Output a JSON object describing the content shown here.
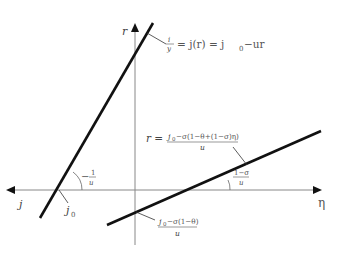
{
  "diagram": {
    "axes": {
      "vertical_label": "r",
      "horizontal_right_label": "η",
      "horizontal_left_label": "j"
    },
    "lines": [
      {
        "name": "steep-line",
        "equation_label": {
          "frac_num": "i",
          "frac_den": "y",
          "rest": "= j(r) = j",
          "sub": "0",
          "tail": "−ur"
        },
        "intercept_label": {
          "base": "j",
          "sub": "0"
        },
        "slope_label": {
          "prefix": "−",
          "num": "1",
          "den": "u"
        }
      },
      {
        "name": "shallow-line",
        "equation_label": {
          "lhs": "r =",
          "num_base": "j",
          "num_sub": "0",
          "num_rest": "−σ(1−θ+(1−σ)η)",
          "den": "u"
        },
        "intercept_label": {
          "num_base": "j",
          "num_sub": "0",
          "num_rest": "−σ(1−θ)",
          "den": "u"
        },
        "slope_label": {
          "num": "1−σ",
          "den": "u"
        }
      }
    ]
  }
}
